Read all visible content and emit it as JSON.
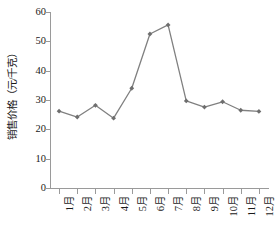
{
  "chart_data": {
    "type": "line",
    "title": "",
    "xlabel": "",
    "ylabel": "销售价格（元/千克）",
    "categories": [
      "1月",
      "2月",
      "3月",
      "4月",
      "5月",
      "6月",
      "7月",
      "8月",
      "9月",
      "10月",
      "11月",
      "12月"
    ],
    "values": [
      26.2,
      24.2,
      28.2,
      23.8,
      34.0,
      52.5,
      55.6,
      29.7,
      27.6,
      29.4,
      26.5,
      26.1
    ],
    "series": [
      {
        "name": "销售价格",
        "values": [
          26.2,
          24.2,
          28.2,
          23.8,
          34.0,
          52.5,
          55.6,
          29.7,
          27.6,
          29.4,
          26.5,
          26.1
        ]
      }
    ],
    "ylim": [
      0,
      60
    ],
    "yticks": [
      0,
      10,
      20,
      30,
      40,
      50,
      60
    ],
    "ytick_labels": [
      "0",
      "10",
      "20",
      "30",
      "40",
      "50",
      "60"
    ],
    "grid": false,
    "legend": false,
    "legend_position": "none",
    "marker": "diamond",
    "line_color": "#808080",
    "marker_color": "#6e6e6e",
    "axis_color": "#9a9a9a",
    "text_color": "#1a1a1a",
    "background": "#ffffff"
  }
}
